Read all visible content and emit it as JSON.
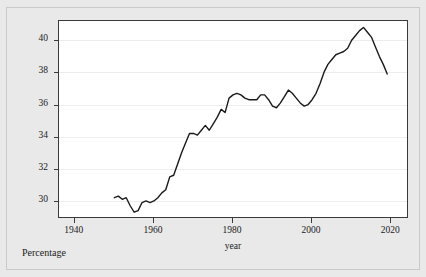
{
  "chart_data": {
    "type": "line",
    "title": "",
    "xlabel": "year",
    "ylabel": "Not in labor force out of population age 15 and above",
    "ylabel_line1": "Not in labor force out of population",
    "ylabel_line2": "age 15 and above",
    "caption": "Percentage",
    "xlim": [
      1936,
      2024
    ],
    "ylim": [
      29.0,
      41.2
    ],
    "xticks": [
      1940,
      1960,
      1980,
      2000,
      2020
    ],
    "xtick_labels": [
      "1940",
      "1960",
      "1980",
      "2000",
      "2020"
    ],
    "yticks": [
      30,
      32,
      34,
      36,
      38,
      40
    ],
    "ytick_labels": [
      "30",
      "32",
      "34",
      "36",
      "38",
      "40"
    ],
    "grid": true,
    "legend": "none",
    "line_color": "#1a1a1a",
    "line_width": 1.4,
    "series": [
      {
        "name": "Not in labor force out of population age 15 and above",
        "x": [
          1950,
          1951,
          1952,
          1953,
          1954,
          1955,
          1956,
          1957,
          1958,
          1959,
          1960,
          1961,
          1962,
          1963,
          1964,
          1965,
          1966,
          1967,
          1968,
          1969,
          1970,
          1971,
          1972,
          1973,
          1974,
          1975,
          1976,
          1977,
          1978,
          1979,
          1980,
          1981,
          1982,
          1983,
          1984,
          1985,
          1986,
          1987,
          1988,
          1989,
          1990,
          1991,
          1992,
          1993,
          1994,
          1995,
          1996,
          1997,
          1998,
          1999,
          2000,
          2001,
          2002,
          2003,
          2004,
          2005,
          2006,
          2007,
          2008,
          2009,
          2010,
          2011,
          2012,
          2013,
          2014,
          2015,
          2016,
          2017,
          2018,
          2019
        ],
        "y": [
          30.2,
          30.3,
          30.1,
          30.2,
          29.7,
          29.3,
          29.4,
          29.9,
          30.0,
          29.9,
          30.0,
          30.2,
          30.5,
          30.7,
          31.5,
          31.6,
          32.3,
          33.0,
          33.6,
          34.2,
          34.2,
          34.1,
          34.4,
          34.7,
          34.4,
          34.8,
          35.2,
          35.7,
          35.5,
          36.4,
          36.6,
          36.7,
          36.6,
          36.4,
          36.3,
          36.3,
          36.3,
          36.6,
          36.6,
          36.3,
          35.9,
          35.8,
          36.1,
          36.5,
          36.9,
          36.7,
          36.4,
          36.1,
          35.9,
          36.0,
          36.3,
          36.7,
          37.3,
          38.0,
          38.5,
          38.8,
          39.1,
          39.2,
          39.3,
          39.5,
          40.0,
          40.3,
          40.6,
          40.8,
          40.5,
          40.2,
          39.6,
          39.0,
          38.5,
          37.9
        ]
      }
    ]
  },
  "axis": {
    "ytick_count": 6,
    "xtick_count": 5
  }
}
